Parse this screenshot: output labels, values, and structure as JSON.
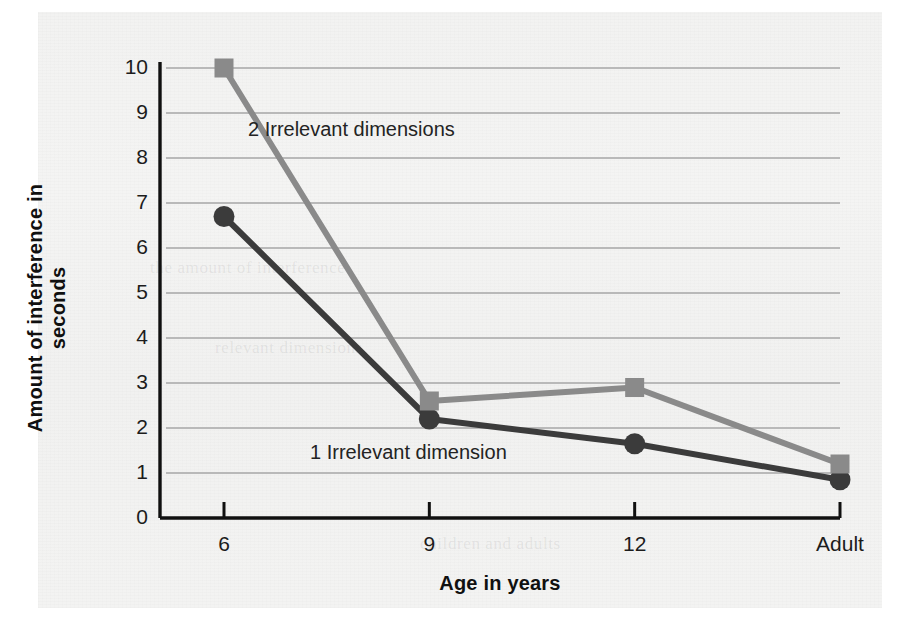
{
  "chart_data": {
    "type": "line",
    "title": "",
    "xlabel": "Age in years",
    "ylabel": "Amount of interference in seconds",
    "categories": [
      "6",
      "9",
      "12",
      "Adult"
    ],
    "x_tick_labels": [
      "6",
      "9",
      "12",
      "Adult"
    ],
    "x_origin_label": "0",
    "y_tick_labels": [
      "10",
      "9",
      "8",
      "7",
      "6",
      "5",
      "4",
      "3",
      "2",
      "1",
      "0"
    ],
    "y_ticks": [
      0,
      1,
      2,
      3,
      4,
      5,
      6,
      7,
      8,
      9,
      10
    ],
    "ylim": [
      0,
      10
    ],
    "grid": true,
    "grid_axis": "y",
    "legend_position": "inline-annotations",
    "series": [
      {
        "name": "2 Irrelevant dimensions",
        "marker": "square",
        "color": "#8a8a8a",
        "values": [
          10.0,
          2.6,
          2.9,
          1.2
        ]
      },
      {
        "name": "1 Irrelevant dimension",
        "marker": "circle",
        "color": "#3b3b3b",
        "values": [
          6.7,
          2.2,
          1.65,
          0.85
        ]
      }
    ],
    "annotations": [
      {
        "text": "2 Irrelevant dimensions",
        "x_px": 248,
        "y_px": 128
      },
      {
        "text": "1 Irrelevant dimension",
        "x_px": 310,
        "y_px": 451
      }
    ]
  },
  "colors": {
    "axis": "#101010",
    "gridline": "#b9b9b9",
    "series_two_irrelevant": "#8a8a8a",
    "series_one_irrelevant": "#3b3b3b",
    "page_background": "#f3f3f2",
    "text": "#1c1c1c"
  },
  "ghost_text": [
    "the amount of interference",
    "relevant dimensions",
    "children and adults"
  ]
}
